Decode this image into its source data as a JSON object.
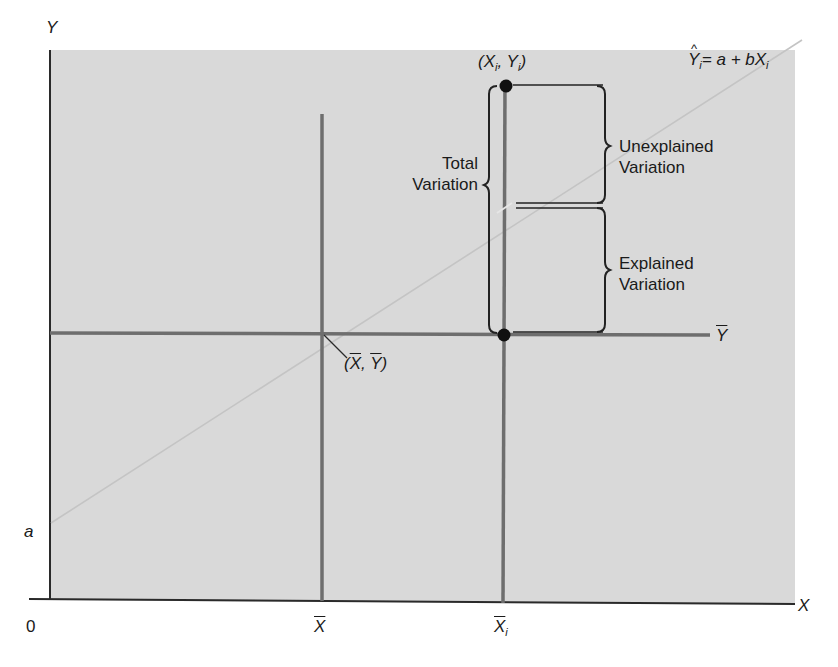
{
  "figure": {
    "axis_y_label": "Y",
    "axis_x_label": "X",
    "origin_label": "0",
    "intercept_label": "a",
    "xbar_label": "X",
    "xi_label": "X",
    "xi_subscript": "i",
    "ybar_label": "Y",
    "mean_point_label": {
      "open": "(",
      "x": "X",
      "sep": ", ",
      "y": "Y",
      "close": ")"
    },
    "data_point_label": {
      "open": "(",
      "x": "X",
      "x_sub": "i",
      "sep": ", ",
      "y": "Y",
      "y_sub": "i",
      "close": ")"
    },
    "regression_equation": {
      "lhs": "Y",
      "lhs_sub": "i",
      "hat": "^",
      "rhs": "= a + bX",
      "rhs_sub": "i"
    },
    "total_variation": [
      "Total",
      "Variation"
    ],
    "unexplained_variation": [
      "Unexplained",
      "Variation"
    ],
    "explained_variation": [
      "Explained",
      "Variation"
    ]
  },
  "colors": {
    "panel": "#d9d9d9",
    "axis": "#2a2a2a",
    "guide_line": "#6e6e6e",
    "regression_line": "#bdbdbd",
    "point": "#111111",
    "bracket": "#222222"
  }
}
